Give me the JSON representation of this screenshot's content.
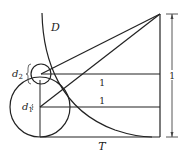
{
  "diagram": {
    "labels": {
      "curve": "D",
      "small_circle": "d",
      "small_circle_sub": "2",
      "large_circle": "d",
      "large_circle_sub": "1",
      "upper_segment": "1",
      "lower_segment": "1",
      "dimension": "1",
      "baseline": "T"
    },
    "colors": {
      "stroke": "#222222",
      "background": "#ffffff"
    }
  }
}
